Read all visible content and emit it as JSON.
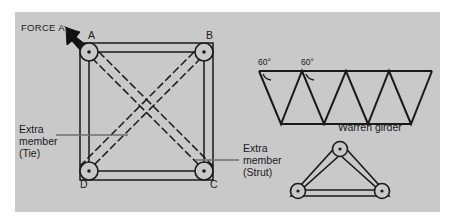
{
  "figure": {
    "background_color": "#c9c9c9",
    "page_color": "#ffffff",
    "line_color": "#1a1a1a",
    "leader_color": "#6e6e6e"
  },
  "force_label": "FORCE A",
  "arrow_icon": "thick-arrow-down-right",
  "frame": {
    "nodes": [
      {
        "id": "A",
        "label": "A",
        "position": "top-left"
      },
      {
        "id": "B",
        "label": "B",
        "position": "top-right"
      },
      {
        "id": "C",
        "label": "C",
        "position": "bottom-right"
      },
      {
        "id": "D",
        "label": "D",
        "position": "bottom-left"
      }
    ],
    "joint_icon": "pin-joint-icon"
  },
  "annotations": {
    "tie": {
      "line1": "Extra",
      "line2": "member",
      "line3": "(Tie)"
    },
    "strut": {
      "line1": "Extra",
      "line2": "member",
      "line3": "(Strut)"
    }
  },
  "warren": {
    "caption": "Warren girder",
    "angle_1": "60°",
    "angle_2": "60°",
    "arc_icon": "angle-arc-icon"
  },
  "triangle_truss": {
    "joint_icon": "pin-joint-icon",
    "joint_count": 3
  }
}
